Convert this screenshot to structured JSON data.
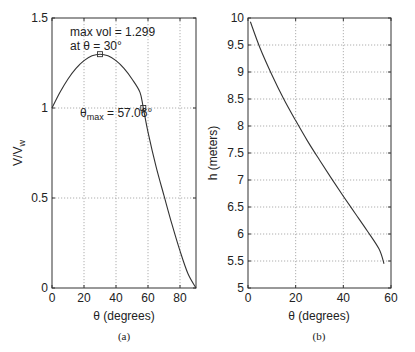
{
  "chart_data": [
    {
      "type": "line",
      "panel": "(a)",
      "title": "",
      "xlabel": "θ (degrees)",
      "ylabel": "V/V_w",
      "ylabel_main": "V/V",
      "ylabel_sub": "w",
      "xlim": [
        0,
        90
      ],
      "ylim": [
        0,
        1.5
      ],
      "xticks": [
        0,
        20,
        40,
        60,
        80
      ],
      "yticks": [
        0,
        0.5,
        1,
        1.5
      ],
      "ytick_labels": [
        "0",
        "0.5",
        "1",
        "1.5"
      ],
      "grid": true,
      "x": [
        0,
        5,
        10,
        15,
        20,
        25,
        30,
        35,
        40,
        45,
        50,
        55,
        57.06,
        60,
        65,
        70,
        75,
        80,
        85,
        90
      ],
      "y": [
        1.0,
        1.087,
        1.161,
        1.22,
        1.263,
        1.29,
        1.299,
        1.29,
        1.263,
        1.22,
        1.161,
        1.087,
        1.0,
        0.866,
        0.676,
        0.513,
        0.353,
        0.206,
        0.079,
        0.0
      ],
      "markers": [
        {
          "x": 30,
          "y": 1.299,
          "shape": "square"
        },
        {
          "x": 57.06,
          "y": 1.0,
          "shape": "square"
        }
      ],
      "annotations": [
        {
          "text": "max vol = 1.299",
          "line": 1
        },
        {
          "text": "at θ = 30°",
          "line": 2
        },
        {
          "text_main": "θ",
          "text_sub": "max",
          "text_rest": " = 57.06°"
        }
      ]
    },
    {
      "type": "line",
      "panel": "(b)",
      "title": "",
      "xlabel": "θ (degrees)",
      "ylabel": "h (meters)",
      "xlim": [
        0,
        60
      ],
      "ylim": [
        5,
        10
      ],
      "xticks": [
        0,
        20,
        40,
        60
      ],
      "yticks": [
        5,
        5.5,
        6,
        6.5,
        7,
        7.5,
        8,
        8.5,
        9,
        9.5,
        10
      ],
      "ytick_labels": [
        "5",
        "5.5",
        "6",
        "6.5",
        "7",
        "7.5",
        "8",
        "8.5",
        "9",
        "9.5",
        "10"
      ],
      "grid": true,
      "x": [
        1,
        5,
        10,
        15,
        20,
        25,
        30,
        35,
        40,
        45,
        50,
        55,
        57.06
      ],
      "y": [
        9.93,
        9.45,
        8.95,
        8.5,
        8.1,
        7.72,
        7.37,
        7.03,
        6.7,
        6.38,
        6.06,
        5.72,
        5.45
      ]
    }
  ],
  "captions": {
    "a": "(a)",
    "b": "(b)"
  },
  "colors": {
    "line": "#333333",
    "grid": "#9a9a9a",
    "background": "#ffffff"
  }
}
